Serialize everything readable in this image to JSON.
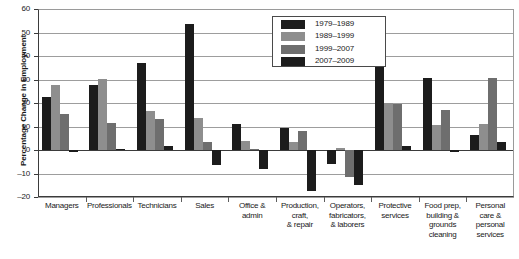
{
  "chart_data": {
    "type": "bar",
    "title": "",
    "subtitle": "",
    "xlabel": "",
    "ylabel": "Percentage Change in Employment",
    "ylim": [
      -20,
      60
    ],
    "ytick_values": [
      60,
      50,
      40,
      30,
      20,
      10,
      0,
      -10,
      -20
    ],
    "ytick_labels": [
      "60",
      "50",
      "40",
      "30",
      "20",
      "10",
      "0",
      "–10",
      "–20"
    ],
    "grid": true,
    "legend_position": "top-center-right",
    "categories": [
      "Managers",
      "Professionals",
      "Technicians",
      "Sales",
      "Office &\nadmin",
      "Production,\ncraft,\n& repair",
      "Operators,\nfabricators,\n& laborers",
      "Protective\nservices",
      "Food prep,\nbuilding &\ngrounds\ncleaning",
      "Personal\ncare &\npersonal\nservices"
    ],
    "series": [
      {
        "name": "1979–1989",
        "color": "#1c1c1c",
        "values": [
          22.5,
          27.8,
          37.1,
          53.6,
          11.2,
          9.5,
          -5.8,
          35.9,
          30.7,
          6.3
        ]
      },
      {
        "name": "1989–1999",
        "color": "#8e8e8e",
        "values": [
          27.5,
          30.4,
          16.8,
          13.5,
          3.7,
          3.6,
          1.0,
          19.8,
          10.6,
          11.0
        ]
      },
      {
        "name": "1999–2007",
        "color": "#6e6e6e",
        "values": [
          15.3,
          11.3,
          13.4,
          3.2,
          0.3,
          8.2,
          -11.5,
          19.4,
          17.2,
          30.6
        ]
      },
      {
        "name": "2007–2009",
        "color": "#1c1c1c",
        "values": [
          -1.0,
          0.4,
          1.9,
          -6.5,
          -8.2,
          -17.5,
          -15.0,
          1.7,
          -1.0,
          3.4
        ]
      }
    ]
  }
}
